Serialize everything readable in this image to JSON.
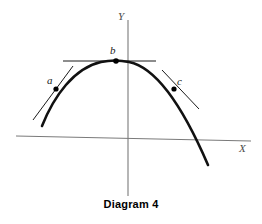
{
  "figure": {
    "caption": "Diagram 4",
    "background_color": "#ffffff"
  },
  "axes": {
    "x": {
      "label": "X",
      "color": "#7a7a7a",
      "start": [
        16,
        136
      ],
      "end": [
        251,
        141
      ]
    },
    "y": {
      "label": "Y",
      "color": "#7a7a7a",
      "start": [
        128,
        20
      ],
      "end": [
        128,
        196
      ]
    }
  },
  "curve": {
    "name": "parabola",
    "color": "#111111",
    "stroke_width": 2.6,
    "description": "downward-opening parabola",
    "path": "M 42,126 C 54,96 74,68 101,62 C 110,60 120,60 129,62 C 154,67 180,100 208,165"
  },
  "points": [
    {
      "id": "a",
      "label": "a",
      "cx": 56,
      "cy": 89,
      "tangent": {
        "x1": 33,
        "y1": 120,
        "x2": 73,
        "y2": 66
      },
      "tangent_color": "#1a1a1a"
    },
    {
      "id": "b",
      "label": "b",
      "cx": 116,
      "cy": 61,
      "tangent": {
        "x1": 63,
        "y1": 61,
        "x2": 156,
        "y2": 61
      },
      "tangent_color": "#1a1a1a"
    },
    {
      "id": "c",
      "label": "c",
      "cx": 174,
      "cy": 89,
      "tangent": {
        "x1": 162,
        "y1": 70,
        "x2": 199,
        "y2": 109
      },
      "tangent_color": "#1a1a1a"
    }
  ],
  "point_marker": {
    "radius": 2.6,
    "color": "#000000"
  }
}
